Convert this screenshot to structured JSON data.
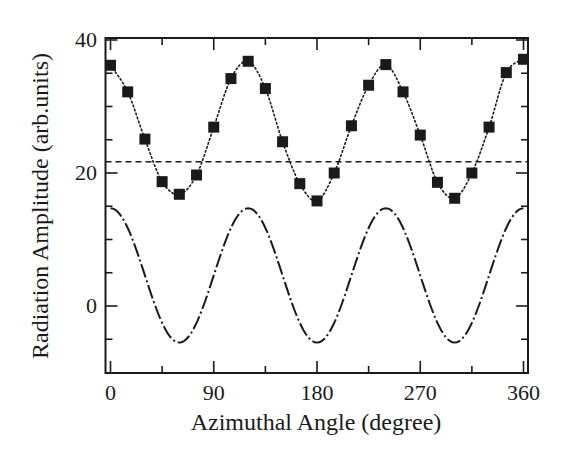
{
  "chart_data": {
    "type": "line",
    "title": "",
    "xlabel": "Azimuthal Angle (degree)",
    "ylabel": "Radiation Amplitude (arb.units)",
    "xlim": [
      0,
      360
    ],
    "ylim": [
      -10,
      40
    ],
    "grid": false,
    "legend": null,
    "x_ticks": [
      0,
      90,
      180,
      270,
      360
    ],
    "x_tick_labels": [
      "0",
      "90",
      "180",
      "270",
      "360"
    ],
    "x_minor_ticks": [
      45,
      135,
      225,
      315
    ],
    "y_ticks": [
      0,
      20,
      40
    ],
    "y_tick_labels": [
      "0",
      "20",
      "40"
    ],
    "y_minor_ticks": [
      -5,
      5,
      10,
      15,
      25,
      30,
      35
    ],
    "series": [
      {
        "name": "measured",
        "style": "squares-dotted",
        "x": [
          0,
          15,
          30,
          45,
          60,
          75,
          90,
          105,
          120,
          135,
          150,
          165,
          180,
          195,
          210,
          225,
          240,
          255,
          270,
          285,
          300,
          315,
          330,
          345,
          360
        ],
        "values": [
          36.2,
          32.2,
          25.1,
          18.7,
          16.8,
          19.7,
          26.9,
          34.2,
          36.8,
          32.7,
          24.7,
          18.4,
          15.8,
          20.0,
          27.1,
          33.2,
          36.3,
          32.2,
          25.7,
          18.6,
          16.2,
          20.0,
          26.9,
          35.1,
          37.1
        ]
      },
      {
        "name": "constant level",
        "style": "dashed",
        "x": [
          0,
          360
        ],
        "values": [
          21.7,
          21.7
        ]
      },
      {
        "name": "cos(3θ) component",
        "style": "dash-dot",
        "formula": "4.6 + 10.1*cos(3*theta)",
        "x": [
          0,
          30,
          60,
          90,
          120,
          150,
          180,
          210,
          240,
          270,
          300,
          330,
          360
        ],
        "values": [
          14.7,
          4.6,
          -5.5,
          4.6,
          14.7,
          4.6,
          -5.5,
          4.6,
          14.7,
          4.6,
          -5.5,
          4.6,
          14.7
        ]
      }
    ]
  },
  "colors": {
    "ink": "#1a1a1a",
    "background": "#ffffff"
  }
}
